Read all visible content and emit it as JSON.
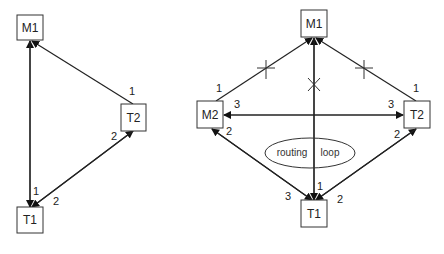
{
  "left_diagram": {
    "nodes": {
      "m1": "M1",
      "t2": "T2",
      "t1": "T1"
    },
    "port_labels": {
      "t2_to_m1": "1",
      "t2_to_t1": "2",
      "t1_to_m1": "1",
      "t1_to_t2": "2"
    }
  },
  "right_diagram": {
    "nodes": {
      "m1": "M1",
      "m2": "M2",
      "t2": "T2",
      "t1": "T1"
    },
    "port_labels": {
      "m2_to_m1": "1",
      "m2_to_t2": "3",
      "m2_to_t1": "2",
      "t2_to_m1": "1",
      "t2_to_m2": "3",
      "t2_to_t1": "2",
      "t1_to_m1": "1",
      "t1_to_m2": "3",
      "t1_to_t2": "2"
    },
    "annotation": {
      "left_text": "routing",
      "right_text": "loop"
    }
  }
}
